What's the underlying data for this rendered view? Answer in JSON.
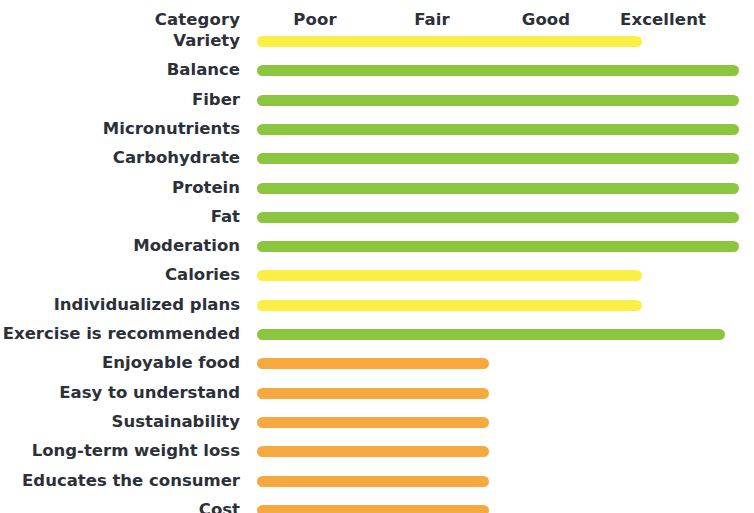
{
  "chart_data": {
    "type": "bar",
    "title": "",
    "xlabel": "",
    "ylabel": "Category",
    "orientation": "horizontal",
    "grid": false,
    "legend": false,
    "scale_labels": [
      "Poor",
      "Fair",
      "Good",
      "Excellent"
    ],
    "scale_values": [
      1,
      2,
      3,
      4
    ],
    "xlim": [
      0,
      4
    ],
    "category_header": "Category",
    "categories": [
      "Variety",
      "Balance",
      "Fiber",
      "Micronutrients",
      "Carbohydrate",
      "Protein",
      "Fat",
      "Moderation",
      "Calories",
      "Individualized plans",
      "Exercise is recommended",
      "Enjoyable food",
      "Easy to understand",
      "Sustainability",
      "Long-term weight loss",
      "Educates the consumer",
      "Cost"
    ],
    "values": [
      3.3,
      4.0,
      4.0,
      4.0,
      4.0,
      4.0,
      4.0,
      4.0,
      3.3,
      3.3,
      3.9,
      2.2,
      2.2,
      2.2,
      2.2,
      2.2,
      2.2
    ],
    "ratings": [
      "Good",
      "Excellent",
      "Excellent",
      "Excellent",
      "Excellent",
      "Excellent",
      "Excellent",
      "Excellent",
      "Good",
      "Good",
      "Excellent",
      "Fair",
      "Fair",
      "Fair",
      "Fair",
      "Fair",
      "Fair"
    ],
    "bar_colors": [
      "#f9ef45",
      "#8cc63f",
      "#8cc63f",
      "#8cc63f",
      "#8cc63f",
      "#8cc63f",
      "#8cc63f",
      "#8cc63f",
      "#f9ef45",
      "#f9ef45",
      "#8cc63f",
      "#f5a93f",
      "#f5a93f",
      "#f5a93f",
      "#f5a93f",
      "#f5a93f",
      "#f5a93f"
    ]
  },
  "colors": {
    "background": "#ffffff",
    "text": "#2c3038",
    "yellow": "#f9ef45",
    "green": "#8cc63f",
    "orange": "#f5a93f"
  }
}
